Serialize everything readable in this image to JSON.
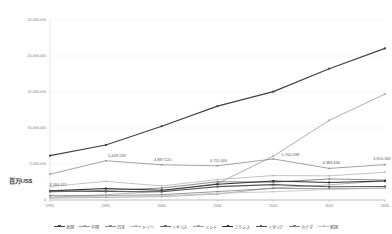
{
  "chart_data": {
    "type": "line",
    "title": "",
    "subtitle": "",
    "xlabel": "",
    "ylabel": "百万US$",
    "x": [
      "1991",
      "1995",
      "2000",
      "2005",
      "2010",
      "2015",
      "2020"
    ],
    "xlim": [
      0,
      6
    ],
    "ylim": [
      0,
      25000000
    ],
    "yticks": [
      0,
      5000000,
      10000000,
      15000000,
      20000000,
      25000000
    ],
    "ytick_labels": [
      "0",
      "5,000,000",
      "10,000,000",
      "15,000,000",
      "20,000,000",
      "25,000,000"
    ],
    "grid": true,
    "legend_position": "bottom",
    "series": [
      {
        "name": "米国",
        "color": "#404040",
        "values": [
          6158129,
          7639749,
          10250952,
          13039197,
          15048970,
          18238301,
          21060474
        ]
      },
      {
        "name": "中国",
        "color": "#9a9a9a",
        "values": [
          383373,
          734548,
          1211347,
          2285966,
          6087164,
          11061553,
          14722731
        ]
      },
      {
        "name": "日本",
        "color": "#8c8c8c",
        "values": [
          3584421,
          5449138,
          4887520,
          4755400,
          5700098,
          4389436,
          4910580
        ],
        "labeled": true,
        "labels": [
          "3,584,421",
          "5,449,138",
          "4,887,520",
          "4,755,400",
          "5,700,098",
          "4,389,436",
          "4,910,580"
        ]
      },
      {
        "name": "ドイツ",
        "color": "#b5b5b5",
        "values": [
          1867800,
          2591600,
          1947000,
          2846100,
          3396350,
          3356236,
          3846414
        ]
      },
      {
        "name": "イギリス",
        "color": "#6e6e6e",
        "values": [
          1133200,
          1340100,
          1657800,
          2538680,
          2475244,
          2928591,
          2764198
        ]
      },
      {
        "name": "インド",
        "color": "#a0a0a0",
        "values": [
          270105,
          360282,
          468395,
          820382,
          1675616,
          2103588,
          2667688
        ]
      },
      {
        "name": "フランス",
        "color": "#2e2e2e",
        "values": [
          1269700,
          1609800,
          1368000,
          2196100,
          2645188,
          2439189,
          2630318
        ]
      },
      {
        "name": "イタリア",
        "color": "#555555",
        "values": [
          1239200,
          1171000,
          1147700,
          1858100,
          2136100,
          1836638,
          1888709
        ]
      },
      {
        "name": "カナダ",
        "color": "#7d7d7d",
        "values": [
          611400,
          604000,
          742300,
          1169360,
          1617343,
          1556509,
          1645423
        ]
      },
      {
        "name": "韓国",
        "color": "#c0c0c0",
        "values": [
          330600,
          566100,
          576200,
          934900,
          1144067,
          1465773,
          1637896
        ]
      }
    ]
  },
  "axis": {
    "unit_label": "百万US$"
  }
}
